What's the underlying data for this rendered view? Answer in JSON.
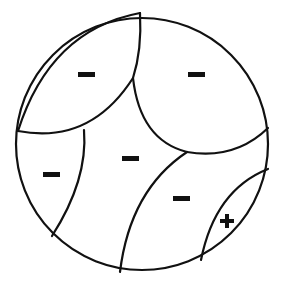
{
  "diagram": {
    "title": "",
    "regions": [
      {
        "id": "top-left",
        "sign": "−",
        "polarity": "negative"
      },
      {
        "id": "top-right",
        "sign": "−",
        "polarity": "negative"
      },
      {
        "id": "left",
        "sign": "−",
        "polarity": "negative"
      },
      {
        "id": "center",
        "sign": "−",
        "polarity": "negative"
      },
      {
        "id": "lower-right",
        "sign": "−",
        "polarity": "negative"
      },
      {
        "id": "small-bottom-right",
        "sign": "+",
        "polarity": "positive"
      }
    ],
    "colors": {
      "stroke": "#111111",
      "background": "#ffffff"
    }
  }
}
